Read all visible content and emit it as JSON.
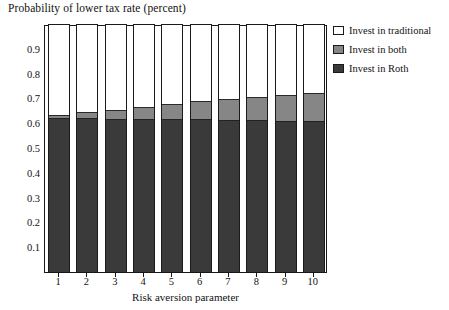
{
  "chart_data": {
    "type": "bar",
    "stacked": true,
    "title": "Probability of lower tax rate (percent)",
    "xlabel": "Risk aversion parameter",
    "ylabel": "",
    "categories": [
      "1",
      "2",
      "3",
      "4",
      "5",
      "6",
      "7",
      "8",
      "9",
      "10"
    ],
    "ylim": [
      0,
      1
    ],
    "yticks": [
      0.1,
      0.2,
      0.3,
      0.4,
      0.5,
      0.6,
      0.7,
      0.8,
      0.9
    ],
    "ytick_labels": [
      "0.1",
      "0.2",
      "0.3",
      "0.4",
      "0.5",
      "0.6",
      "0.7",
      "0.8",
      "0.9"
    ],
    "grid": false,
    "legend_position": "top-right",
    "series": [
      {
        "name": "Invest in Roth",
        "color": "#3a3a3a",
        "values": [
          0.62,
          0.62,
          0.618,
          0.617,
          0.616,
          0.615,
          0.613,
          0.612,
          0.61,
          0.608
        ]
      },
      {
        "name": "Invest in both",
        "color": "#868686",
        "values": [
          0.015,
          0.025,
          0.037,
          0.05,
          0.062,
          0.073,
          0.086,
          0.095,
          0.105,
          0.115
        ]
      },
      {
        "name": "Invest in traditional",
        "color": "#ffffff",
        "values": [
          0.365,
          0.355,
          0.345,
          0.333,
          0.322,
          0.312,
          0.301,
          0.293,
          0.285,
          0.277
        ]
      }
    ],
    "totals_colored": [
      0.635,
      0.645,
      0.655,
      0.667,
      0.678,
      0.688,
      0.699,
      0.707,
      0.715,
      0.723
    ]
  },
  "legend": {
    "items": [
      {
        "label": "Invest in traditional",
        "color": "#ffffff"
      },
      {
        "label": "Invest in both",
        "color": "#868686"
      },
      {
        "label": "Invest in Roth",
        "color": "#3a3a3a"
      }
    ]
  }
}
